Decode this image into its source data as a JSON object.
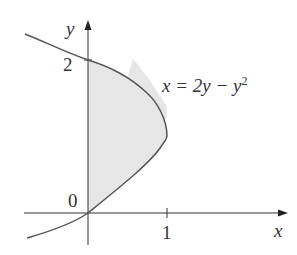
{
  "figure": {
    "curve_label": "x = 2y − y",
    "curve_label_exp": "2",
    "x_axis_label": "x",
    "y_axis_label": "y",
    "origin_label": "0",
    "x_tick_label": "1",
    "y_tick_label": "2",
    "colors": {
      "curve": "#555555",
      "fill": "#e6e6e6",
      "axis": "#333333"
    }
  }
}
